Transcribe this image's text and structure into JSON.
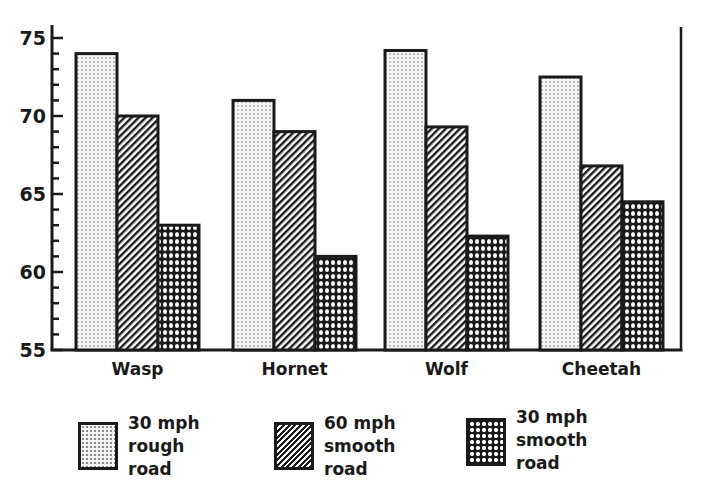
{
  "chart_data": {
    "type": "bar",
    "title": "",
    "xlabel": "",
    "ylabel": "",
    "ylim": [
      55,
      75
    ],
    "yticks": [
      55,
      60,
      65,
      70,
      75
    ],
    "minor_tick_step": 1,
    "grid": false,
    "legend_position": "bottom",
    "categories": [
      "Wasp",
      "Hornet",
      "Wolf",
      "Cheetah"
    ],
    "series": [
      {
        "name": "30 mph rough road",
        "pattern": "dots",
        "values": [
          74,
          71,
          74.2,
          72.5
        ]
      },
      {
        "name": "60 mph smooth road",
        "pattern": "diagonal-hatch",
        "values": [
          70,
          69,
          69.3,
          66.8
        ]
      },
      {
        "name": "30 mph smooth road",
        "pattern": "crosshatch",
        "values": [
          63,
          61,
          62.3,
          64.5
        ]
      }
    ]
  },
  "legend": [
    {
      "lines": [
        "30 mph",
        "rough",
        "road"
      ]
    },
    {
      "lines": [
        "60 mph",
        "smooth",
        "road"
      ]
    },
    {
      "lines": [
        "30 mph",
        "smooth",
        "road"
      ]
    }
  ],
  "colors": {
    "ink": "#1a1a1a",
    "background": "#ffffff"
  }
}
